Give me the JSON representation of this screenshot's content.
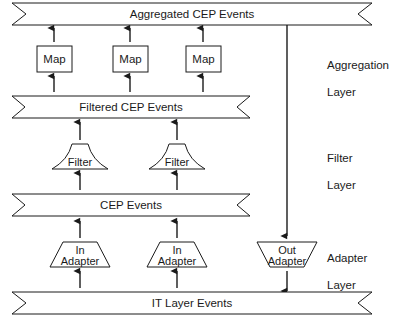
{
  "diagram": {
    "stroke_color": "#1a1a1a",
    "fill_color": "#ffffff",
    "background": "#ffffff",
    "banners": [
      {
        "id": "aggregated-cep-events",
        "label": "Aggregated CEP Events"
      },
      {
        "id": "filtered-cep-events",
        "label": "Filtered CEP Events"
      },
      {
        "id": "cep-events",
        "label": "CEP Events"
      },
      {
        "id": "it-layer-events",
        "label": "IT Layer Events"
      }
    ],
    "maps": [
      {
        "id": "map-1",
        "label": "Map"
      },
      {
        "id": "map-2",
        "label": "Map"
      },
      {
        "id": "map-3",
        "label": "Map"
      }
    ],
    "filters": [
      {
        "id": "filter-1",
        "label": "Filter"
      },
      {
        "id": "filter-2",
        "label": "Filter"
      }
    ],
    "adapters": [
      {
        "id": "in-adapter-1",
        "line1": "In",
        "line2": "Adapter",
        "direction": "in"
      },
      {
        "id": "in-adapter-2",
        "line1": "In",
        "line2": "Adapter",
        "direction": "in"
      },
      {
        "id": "out-adapter-1",
        "line1": "Out",
        "line2": "Adapter",
        "direction": "out"
      }
    ],
    "layer_labels": [
      {
        "id": "aggregation-layer",
        "line1": "Aggregation",
        "line2": "Layer"
      },
      {
        "id": "filter-layer",
        "line1": "Filter",
        "line2": "Layer"
      },
      {
        "id": "adapter-layer",
        "line1": "Adapter",
        "line2": "Layer"
      }
    ]
  }
}
